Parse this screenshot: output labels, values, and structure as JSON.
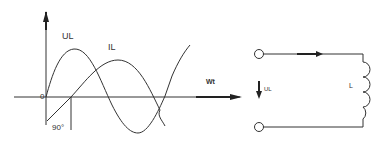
{
  "waveform": {
    "voltage_label": "UL",
    "current_label": "IL",
    "x_axis_label": "Wt",
    "origin_label": "0",
    "phase_label": "90°"
  },
  "circuit": {
    "voltage_label": "UL",
    "inductor_label": "L"
  },
  "colors": {
    "stroke": "#333333",
    "background": "#ffffff"
  }
}
